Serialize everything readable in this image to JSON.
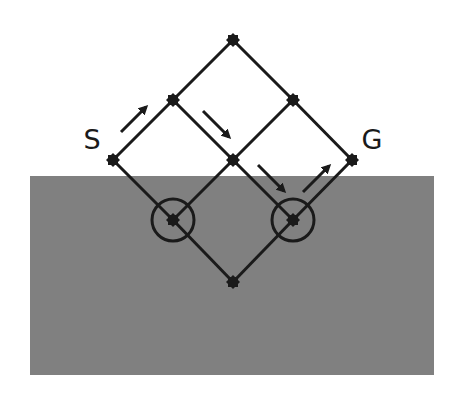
{
  "diagram": {
    "type": "lattice-path-diagram",
    "colors": {
      "background": "#ffffff",
      "region_fill": "#808080",
      "stroke": "#1a1a1a"
    },
    "region": {
      "x": 30,
      "y": 176,
      "width": 404,
      "height": 199
    },
    "labels": [
      {
        "id": "start",
        "text": "S",
        "x": 92,
        "y": 149
      },
      {
        "id": "goal",
        "text": "G",
        "x": 372,
        "y": 149
      }
    ],
    "nodes": [
      {
        "id": "n-top",
        "x": 233,
        "y": 40
      },
      {
        "id": "n-r2-left",
        "x": 173,
        "y": 100
      },
      {
        "id": "n-r2-right",
        "x": 293,
        "y": 100
      },
      {
        "id": "n-start",
        "x": 113,
        "y": 160
      },
      {
        "id": "n-center",
        "x": 233,
        "y": 160
      },
      {
        "id": "n-goal",
        "x": 352,
        "y": 160
      },
      {
        "id": "n-r4-left",
        "x": 173,
        "y": 220,
        "circled": true
      },
      {
        "id": "n-r4-right",
        "x": 293,
        "y": 220,
        "circled": true
      },
      {
        "id": "n-bottom",
        "x": 233,
        "y": 282
      }
    ],
    "edges": [
      [
        "n-start",
        "n-r2-left"
      ],
      [
        "n-r2-left",
        "n-top"
      ],
      [
        "n-top",
        "n-r2-right"
      ],
      [
        "n-r2-right",
        "n-goal"
      ],
      [
        "n-r2-left",
        "n-center"
      ],
      [
        "n-center",
        "n-r2-right"
      ],
      [
        "n-start",
        "n-r4-left"
      ],
      [
        "n-r4-left",
        "n-center"
      ],
      [
        "n-center",
        "n-r4-right"
      ],
      [
        "n-r4-right",
        "n-goal"
      ],
      [
        "n-r4-left",
        "n-bottom"
      ],
      [
        "n-bottom",
        "n-r4-right"
      ]
    ],
    "circle_radius": 21,
    "arrows": [
      {
        "id": "arrow-1",
        "x1": 121,
        "y1": 132,
        "x2": 146,
        "y2": 107,
        "direction": "up-right"
      },
      {
        "id": "arrow-2",
        "x1": 203,
        "y1": 111,
        "x2": 229,
        "y2": 137,
        "direction": "down-right"
      },
      {
        "id": "arrow-3",
        "x1": 258,
        "y1": 165,
        "x2": 284,
        "y2": 191,
        "direction": "down-right"
      },
      {
        "id": "arrow-4",
        "x1": 303,
        "y1": 192,
        "x2": 329,
        "y2": 166,
        "direction": "up-right"
      }
    ]
  }
}
